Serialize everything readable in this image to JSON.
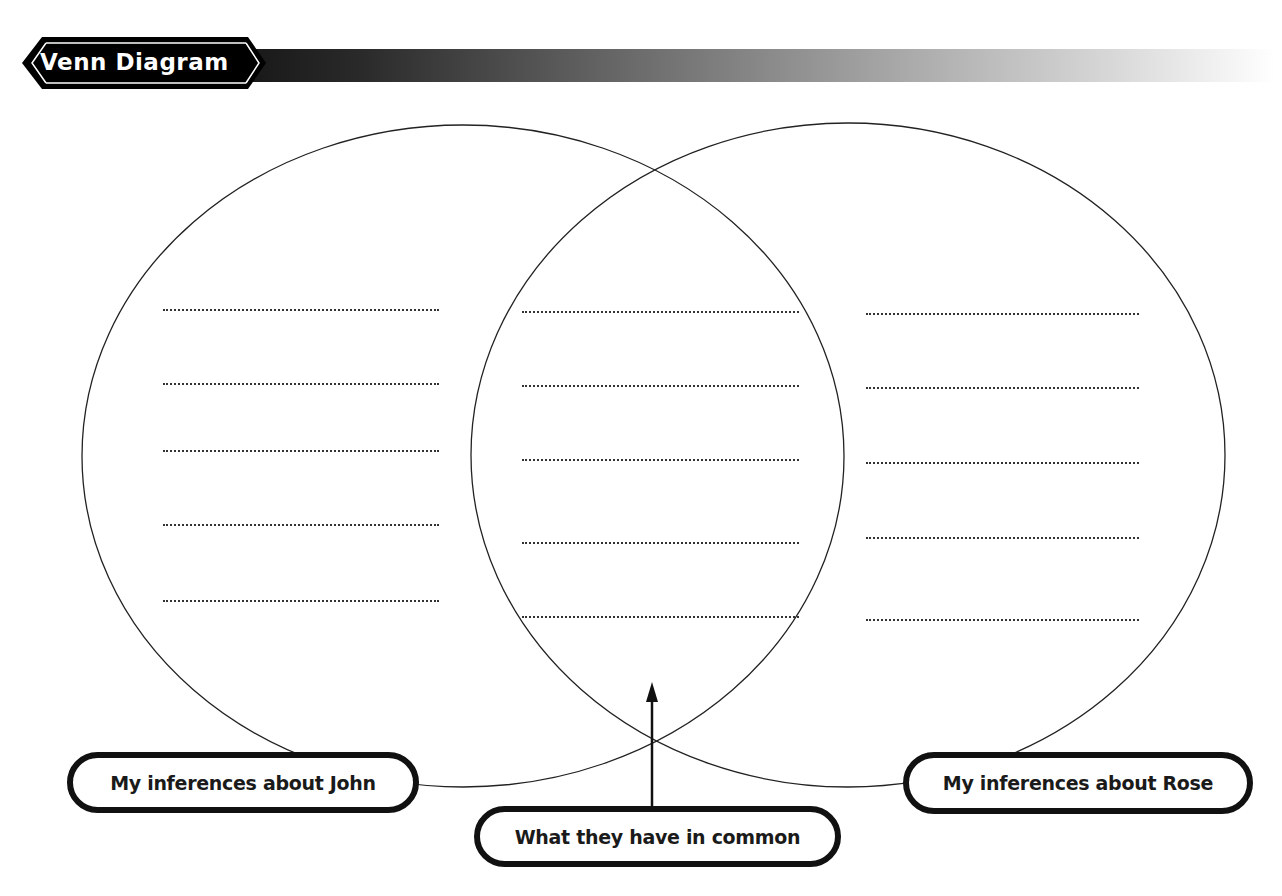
{
  "header": {
    "title": "Venn Diagram"
  },
  "diagram": {
    "type": "venn",
    "sets": [
      {
        "id": "john",
        "label": "My inferences about John",
        "blank_lines": 5
      },
      {
        "id": "common",
        "label": "What they have in common",
        "blank_lines": 5
      },
      {
        "id": "rose",
        "label": "My inferences about Rose",
        "blank_lines": 5
      }
    ],
    "labels": {
      "left": "My inferences about John",
      "middle": "What they have in common",
      "right": "My inferences about Rose"
    }
  },
  "colors": {
    "ink": "#111111",
    "background": "#ffffff"
  }
}
